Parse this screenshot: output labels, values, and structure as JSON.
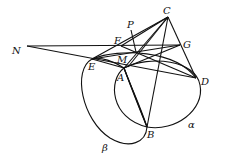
{
  "diagram": {
    "type": "geometry-figure",
    "points": {
      "C": {
        "label": "C",
        "x": 168,
        "y": 17
      },
      "N": {
        "label": "N",
        "x": 27,
        "y": 46
      },
      "F": {
        "label": "F",
        "x": 121,
        "y": 46
      },
      "G": {
        "label": "G",
        "x": 180,
        "y": 45
      },
      "P": {
        "label": "P",
        "x": 134,
        "y": 52
      },
      "E": {
        "label": "E",
        "x": 92,
        "y": 59
      },
      "M": {
        "label": "M",
        "x": 123,
        "y": 64
      },
      "A": {
        "label": "A",
        "x": 124,
        "y": 68
      },
      "D": {
        "label": "D",
        "x": 196,
        "y": 78
      },
      "B": {
        "label": "B",
        "x": 147,
        "y": 127
      }
    },
    "curves": {
      "alpha": {
        "label": "α"
      },
      "beta": {
        "label": "β"
      }
    }
  }
}
